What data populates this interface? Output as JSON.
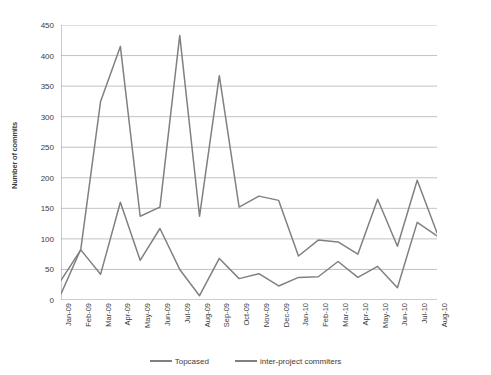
{
  "chart_data": {
    "type": "line",
    "title": "",
    "xlabel": "",
    "ylabel": "Number of commits",
    "ylim": [
      0,
      450
    ],
    "ytick_step": 50,
    "yticks": [
      0,
      50,
      100,
      150,
      200,
      250,
      300,
      350,
      400,
      450
    ],
    "grid": true,
    "legend_position": "bottom",
    "categories": [
      "Jan-09",
      "Feb-09",
      "Mar-09",
      "Apr-09",
      "May-09",
      "Jun-09",
      "Jul-09",
      "Aug-09",
      "Sep-09",
      "Oct-09",
      "Nov-09",
      "Dec-09",
      "Jan-10",
      "Feb-10",
      "Mar-10",
      "Apr-10",
      "May-10",
      "Jun-10",
      "Jul-10",
      "Aug-10"
    ],
    "series": [
      {
        "name": "Topcased",
        "color": "#808080",
        "values": [
          10,
          83,
          325,
          415,
          137,
          152,
          433,
          137,
          367,
          152,
          170,
          163,
          72,
          98,
          95,
          75,
          165,
          88,
          196,
          110
        ]
      },
      {
        "name": "inter-project commiters",
        "color": "#808080",
        "values": [
          32,
          82,
          42,
          160,
          65,
          117,
          50,
          7,
          68,
          35,
          43,
          23,
          37,
          38,
          63,
          37,
          55,
          20,
          127,
          105
        ]
      }
    ]
  },
  "legend": {
    "items": [
      {
        "label": "Topcased",
        "color": "#808080"
      },
      {
        "label": "inter-project commiters",
        "color": "#808080"
      }
    ]
  },
  "axes": {
    "y_title": "Number of commits"
  }
}
